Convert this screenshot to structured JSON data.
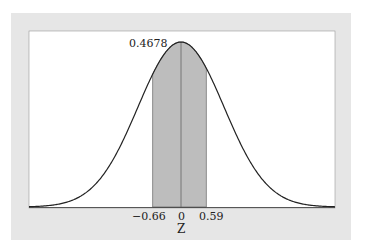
{
  "chart_data": {
    "type": "area",
    "title": "",
    "xlabel": "Z",
    "ylabel": "",
    "distribution": "standard normal",
    "shaded_interval": [
      -0.66,
      0.59
    ],
    "shaded_area": 0.4678,
    "annotation": "0.4678",
    "x_ticks": [
      "-0.66",
      "0",
      "0.59"
    ],
    "xlim": [
      -3.5,
      3.5
    ],
    "grid": false,
    "legend": "none"
  },
  "labels": {
    "area": "0.4678",
    "tick_left": "−0.66",
    "tick_center": "0",
    "tick_right": "0.59",
    "axis": "Z"
  }
}
